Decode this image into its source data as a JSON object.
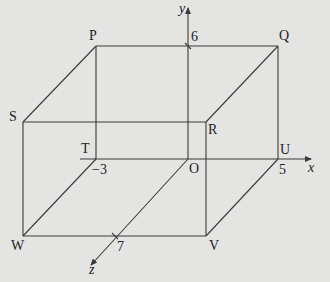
{
  "diagram": {
    "vertices": {
      "P": "P",
      "Q": "Q",
      "R": "R",
      "S": "S",
      "T": "T",
      "O": "O",
      "U": "U",
      "V": "V",
      "W": "W"
    },
    "axes": {
      "x": "x",
      "y": "y",
      "z": "z"
    },
    "ticks": {
      "y_tick": "6",
      "x_neg_tick": "−3",
      "x_pos_tick": "5",
      "z_tick": "7"
    },
    "colors": {
      "background": "#e4e4e2",
      "line": "#3a3a3a",
      "text": "#222222"
    }
  }
}
